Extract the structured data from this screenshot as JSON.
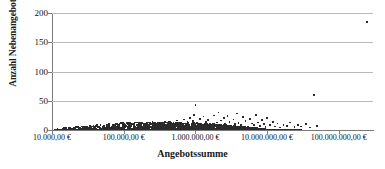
{
  "chart_data": {
    "type": "scatter",
    "title": "",
    "xlabel": "Angebotssumme",
    "ylabel": "Anzahl Nebenangebote",
    "x_scale": "log",
    "y_scale": "linear",
    "xlim": [
      10000,
      300000000
    ],
    "ylim": [
      0,
      200
    ],
    "grid": "horizontal",
    "legend": "none",
    "marker": {
      "shape": "square",
      "size_px": 1.7,
      "color": "#2a2a2a"
    },
    "y_ticks": [
      0,
      50,
      100,
      150,
      200
    ],
    "y_tick_labels": [
      "0",
      "50",
      "100",
      "150",
      "200"
    ],
    "x_ticks": [
      10000,
      100000,
      1000000,
      10000000,
      100000000
    ],
    "x_tick_labels": [
      "10.000,00 €",
      "100.000,00 €",
      "1.000.000,00 €",
      "10.000.000,00 €",
      "100.000.000,00 €"
    ],
    "notable_points": [
      {
        "x": 250000000,
        "y": 185,
        "note": "höchster Ausreißer"
      },
      {
        "x": 45000000,
        "y": 60,
        "note": "zweiter Ausreißer"
      },
      {
        "x": 1000000,
        "y": 43,
        "note": "Maximum der Hauptwolke"
      }
    ],
    "points": [
      [
        13000,
        0
      ],
      [
        15000,
        1
      ],
      [
        17000,
        0
      ],
      [
        19000,
        1
      ],
      [
        21000,
        0
      ],
      [
        24000,
        1
      ],
      [
        27000,
        0
      ],
      [
        30000,
        1
      ],
      [
        33000,
        0
      ],
      [
        36000,
        2
      ],
      [
        40000,
        1
      ],
      [
        44000,
        0
      ],
      [
        48000,
        1
      ],
      [
        52000,
        2
      ],
      [
        56000,
        1
      ],
      [
        60000,
        0
      ],
      [
        65000,
        1
      ],
      [
        70000,
        2
      ],
      [
        75000,
        1
      ],
      [
        80000,
        3
      ],
      [
        85000,
        1
      ],
      [
        90000,
        2
      ],
      [
        95000,
        1
      ],
      [
        100000,
        2
      ],
      [
        105000,
        4
      ],
      [
        110000,
        1
      ],
      [
        115000,
        3
      ],
      [
        120000,
        2
      ],
      [
        125000,
        5
      ],
      [
        130000,
        1
      ],
      [
        135000,
        2
      ],
      [
        140000,
        3
      ],
      [
        145000,
        1
      ],
      [
        150000,
        4
      ],
      [
        155000,
        2
      ],
      [
        160000,
        6
      ],
      [
        165000,
        3
      ],
      [
        170000,
        2
      ],
      [
        175000,
        5
      ],
      [
        180000,
        1
      ],
      [
        185000,
        3
      ],
      [
        190000,
        7
      ],
      [
        195000,
        2
      ],
      [
        200000,
        4
      ],
      [
        210000,
        3
      ],
      [
        220000,
        8
      ],
      [
        230000,
        2
      ],
      [
        240000,
        5
      ],
      [
        250000,
        11
      ],
      [
        260000,
        3
      ],
      [
        270000,
        6
      ],
      [
        280000,
        4
      ],
      [
        290000,
        2
      ],
      [
        300000,
        7
      ],
      [
        320000,
        5
      ],
      [
        340000,
        3
      ],
      [
        360000,
        9
      ],
      [
        380000,
        4
      ],
      [
        400000,
        6
      ],
      [
        420000,
        13
      ],
      [
        440000,
        3
      ],
      [
        460000,
        8
      ],
      [
        480000,
        5
      ],
      [
        500000,
        10
      ],
      [
        520000,
        4
      ],
      [
        540000,
        7
      ],
      [
        560000,
        16
      ],
      [
        580000,
        5
      ],
      [
        600000,
        9
      ],
      [
        620000,
        6
      ],
      [
        640000,
        12
      ],
      [
        660000,
        4
      ],
      [
        680000,
        8
      ],
      [
        700000,
        18
      ],
      [
        720000,
        6
      ],
      [
        740000,
        10
      ],
      [
        760000,
        5
      ],
      [
        780000,
        14
      ],
      [
        800000,
        7
      ],
      [
        820000,
        9
      ],
      [
        840000,
        21
      ],
      [
        860000,
        6
      ],
      [
        880000,
        11
      ],
      [
        900000,
        8
      ],
      [
        920000,
        15
      ],
      [
        940000,
        5
      ],
      [
        960000,
        26
      ],
      [
        980000,
        9
      ],
      [
        1000000,
        43
      ],
      [
        1050000,
        12
      ],
      [
        1100000,
        7
      ],
      [
        1150000,
        19
      ],
      [
        1200000,
        10
      ],
      [
        1250000,
        6
      ],
      [
        1300000,
        23
      ],
      [
        1350000,
        8
      ],
      [
        1400000,
        14
      ],
      [
        1450000,
        5
      ],
      [
        1500000,
        17
      ],
      [
        1600000,
        11
      ],
      [
        1700000,
        9
      ],
      [
        1800000,
        25
      ],
      [
        1900000,
        7
      ],
      [
        2000000,
        13
      ],
      [
        2100000,
        30
      ],
      [
        2200000,
        8
      ],
      [
        2300000,
        16
      ],
      [
        2400000,
        6
      ],
      [
        2500000,
        20
      ],
      [
        2600000,
        11
      ],
      [
        2700000,
        9
      ],
      [
        2800000,
        24
      ],
      [
        3000000,
        14
      ],
      [
        3200000,
        7
      ],
      [
        3400000,
        18
      ],
      [
        3600000,
        10
      ],
      [
        3800000,
        28
      ],
      [
        4000000,
        12
      ],
      [
        4300000,
        8
      ],
      [
        4600000,
        22
      ],
      [
        5000000,
        15
      ],
      [
        5400000,
        6
      ],
      [
        5800000,
        19
      ],
      [
        6200000,
        11
      ],
      [
        6600000,
        9
      ],
      [
        7000000,
        26
      ],
      [
        7500000,
        13
      ],
      [
        8000000,
        7
      ],
      [
        8500000,
        17
      ],
      [
        9000000,
        10
      ],
      [
        9500000,
        5
      ],
      [
        10000000,
        21
      ],
      [
        11000000,
        8
      ],
      [
        12000000,
        14
      ],
      [
        13000000,
        6
      ],
      [
        14000000,
        11
      ],
      [
        15000000,
        4
      ],
      [
        17000000,
        9
      ],
      [
        19000000,
        7
      ],
      [
        21000000,
        13
      ],
      [
        24000000,
        5
      ],
      [
        27000000,
        8
      ],
      [
        30000000,
        6
      ],
      [
        35000000,
        10
      ],
      [
        40000000,
        4
      ],
      [
        45000000,
        60
      ],
      [
        50000000,
        7
      ],
      [
        250000000,
        185
      ]
    ]
  }
}
